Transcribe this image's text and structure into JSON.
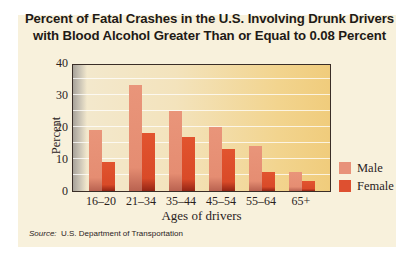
{
  "chart_data": {
    "type": "bar",
    "title": "Percent of Fatal Crashes in the U.S. Involving Drunk Drivers with Blood Alcohol Greater Than or Equal to 0.08 Percent",
    "title_lines": [
      "Percent of Fatal Crashes in the U.S. Involving Drunk Drivers",
      "with Blood Alcohol Greater Than or Equal to 0.08 Percent"
    ],
    "xlabel": "Ages of drivers",
    "ylabel": "Percent",
    "categories": [
      "16–20",
      "21–34",
      "35–44",
      "45–54",
      "55–64",
      "65+"
    ],
    "series": [
      {
        "name": "Male",
        "color": "#e8927a",
        "values": [
          19,
          33,
          25,
          20,
          14,
          6
        ]
      },
      {
        "name": "Female",
        "color": "#de5030",
        "values": [
          9,
          18,
          17,
          13,
          6,
          3
        ]
      }
    ],
    "ylim": [
      0,
      40
    ],
    "yticks": [
      0,
      10,
      20,
      30,
      40
    ],
    "grid": true,
    "grid_step": 5,
    "legend_position": "right"
  },
  "source": {
    "label": "Source:",
    "text": "U.S. Department of Transportation"
  }
}
